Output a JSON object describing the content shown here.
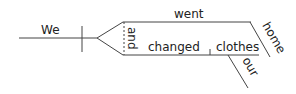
{
  "diagram": {
    "type": "sentence-diagram",
    "subject": "We",
    "conjunction": "and",
    "predicates": [
      {
        "verb": "went",
        "modifiers": [
          "home"
        ]
      },
      {
        "verb": "changed",
        "object": "clothes",
        "object_modifiers": [
          "our"
        ]
      }
    ],
    "line_color": "#444444",
    "text_color": "#222222"
  }
}
